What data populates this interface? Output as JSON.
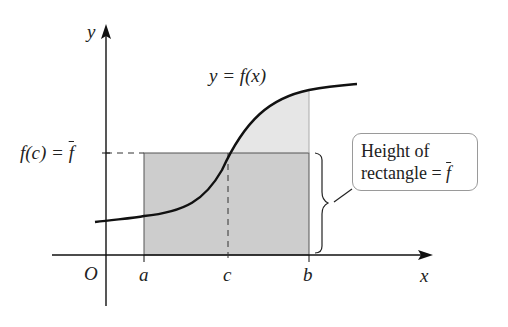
{
  "diagram": {
    "type": "mean-value-theorem-for-integrals",
    "curve_label": "y = f(x)",
    "axis_labels": {
      "x": "x",
      "y": "y",
      "origin": "O"
    },
    "x_ticks": [
      "a",
      "c",
      "b"
    ],
    "y_tick_label": {
      "left": "f(c) = ",
      "fbar": "f"
    },
    "callout": {
      "line1": "Height of",
      "line2": "rectangle = ",
      "fbar": "f"
    },
    "colors": {
      "rect_fill": "#cfcfcf",
      "curve_fill": "#e6e6e6",
      "line": "#111111",
      "callout_border": "#9a9a9a"
    }
  }
}
